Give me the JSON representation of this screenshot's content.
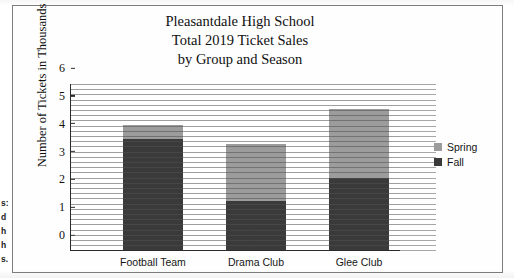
{
  "margin_fragments": [
    "s:",
    "d",
    "h",
    "h",
    "s."
  ],
  "chart_data": {
    "type": "bar",
    "stacked": true,
    "title": "Pleasantdale High School Total 2019 Ticket Sales by Group and Season",
    "title_lines": [
      "Pleasantdale High School",
      "Total 2019 Ticket Sales",
      "by Group and Season"
    ],
    "xlabel": "",
    "ylabel": "Number of Tickets in Thousands",
    "categories": [
      "Football Team",
      "Drama Club",
      "Glee Club"
    ],
    "series": [
      {
        "name": "Fall",
        "color": "#3a3a3a",
        "values": [
          4.0,
          1.75,
          2.6
        ]
      },
      {
        "name": "Spring",
        "color": "#9c9c9c",
        "values": [
          0.5,
          2.05,
          2.45
        ]
      }
    ],
    "totals": [
      4.5,
      3.8,
      5.05
    ],
    "ylim": [
      0,
      6
    ],
    "yticks": [
      0,
      1,
      2,
      3,
      4,
      5,
      6
    ],
    "ytick_labels": [
      "0",
      "1",
      "2",
      "3",
      "4",
      "5",
      "6"
    ],
    "grid": false,
    "legend_position": "right",
    "legend_entries": [
      "Spring",
      "Fall"
    ]
  }
}
